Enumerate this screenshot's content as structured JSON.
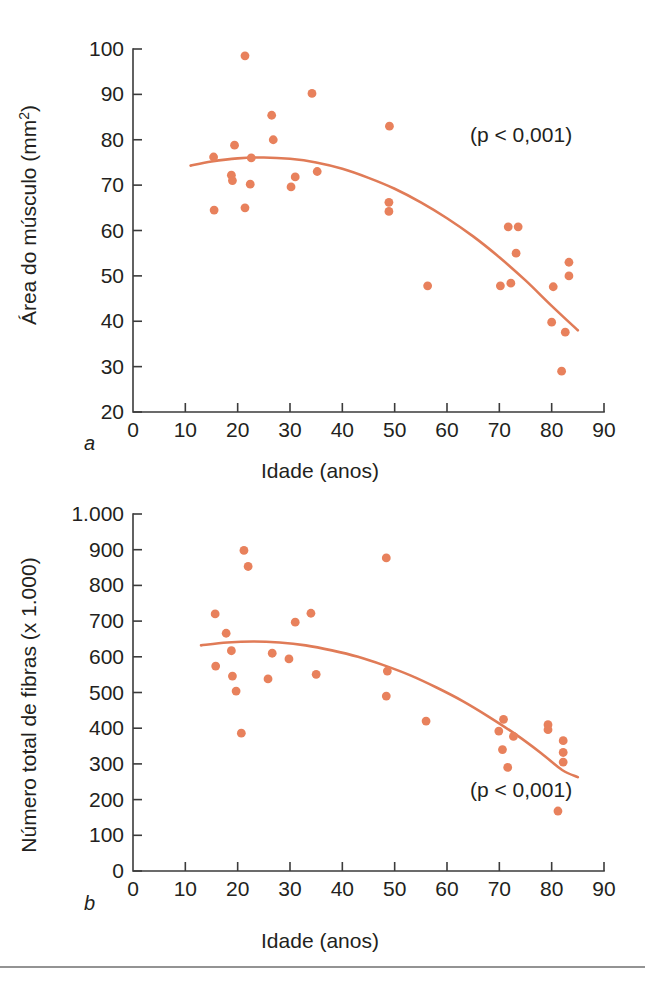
{
  "figure": {
    "dot_color": "#e8815c",
    "line_color": "#e07b57",
    "axis_color": "#3b3b3b",
    "panel_a_letter": "a",
    "panel_b_letter": "b"
  },
  "chart_data": [
    {
      "id": "panel-a",
      "type": "scatter",
      "title": "",
      "panel_label": "a",
      "xlabel": "Idade (anos)",
      "ylabel": "Área do músculo (mm²)",
      "ylabel_main": "Área do músculo (mm",
      "ylabel_sup": "2",
      "ylabel_tail": ")",
      "annotation": "(p < 0,001)",
      "xlim": [
        0,
        90
      ],
      "ylim": [
        20,
        100
      ],
      "xticks": [
        0,
        10,
        20,
        30,
        40,
        50,
        60,
        70,
        80,
        90
      ],
      "xticklabels": [
        "0",
        "10",
        "20",
        "30",
        "40",
        "50",
        "60",
        "70",
        "80",
        "90"
      ],
      "yticks": [
        20,
        30,
        40,
        50,
        60,
        70,
        80,
        90,
        100
      ],
      "yticklabels": [
        "20",
        "30",
        "40",
        "50",
        "60",
        "70",
        "80",
        "90",
        "100"
      ],
      "grid": false,
      "legend": "none",
      "points": [
        {
          "x": 21.4,
          "y": 98.5
        },
        {
          "x": 34.2,
          "y": 90.2
        },
        {
          "x": 26.5,
          "y": 85.4
        },
        {
          "x": 49.0,
          "y": 83.0
        },
        {
          "x": 26.8,
          "y": 80.0
        },
        {
          "x": 19.4,
          "y": 78.8
        },
        {
          "x": 15.4,
          "y": 76.2
        },
        {
          "x": 22.6,
          "y": 76.0
        },
        {
          "x": 35.2,
          "y": 73.0
        },
        {
          "x": 31.0,
          "y": 71.8
        },
        {
          "x": 18.8,
          "y": 72.2
        },
        {
          "x": 19.0,
          "y": 71.0
        },
        {
          "x": 22.4,
          "y": 70.2
        },
        {
          "x": 30.2,
          "y": 69.6
        },
        {
          "x": 48.9,
          "y": 66.2
        },
        {
          "x": 48.9,
          "y": 64.2
        },
        {
          "x": 21.4,
          "y": 65.0
        },
        {
          "x": 15.5,
          "y": 64.5
        },
        {
          "x": 71.7,
          "y": 60.8
        },
        {
          "x": 73.6,
          "y": 60.8
        },
        {
          "x": 73.2,
          "y": 55.0
        },
        {
          "x": 83.3,
          "y": 53.0
        },
        {
          "x": 83.3,
          "y": 50.0
        },
        {
          "x": 70.2,
          "y": 47.8
        },
        {
          "x": 72.2,
          "y": 48.4
        },
        {
          "x": 56.3,
          "y": 47.8
        },
        {
          "x": 80.3,
          "y": 47.6
        },
        {
          "x": 80.0,
          "y": 39.8
        },
        {
          "x": 82.6,
          "y": 37.6
        },
        {
          "x": 81.9,
          "y": 29.0
        }
      ],
      "fit_curve": [
        {
          "x": 11.0,
          "y": 74.3
        },
        {
          "x": 15.0,
          "y": 75.2
        },
        {
          "x": 20.0,
          "y": 75.9
        },
        {
          "x": 25.0,
          "y": 76.1
        },
        {
          "x": 30.0,
          "y": 75.8
        },
        {
          "x": 35.0,
          "y": 75.0
        },
        {
          "x": 40.0,
          "y": 73.6
        },
        {
          "x": 45.0,
          "y": 71.6
        },
        {
          "x": 50.0,
          "y": 69.2
        },
        {
          "x": 55.0,
          "y": 66.2
        },
        {
          "x": 60.0,
          "y": 62.7
        },
        {
          "x": 65.0,
          "y": 58.7
        },
        {
          "x": 70.0,
          "y": 54.1
        },
        {
          "x": 75.0,
          "y": 49.0
        },
        {
          "x": 80.0,
          "y": 43.4
        },
        {
          "x": 85.0,
          "y": 38.0
        }
      ]
    },
    {
      "id": "panel-b",
      "type": "scatter",
      "title": "",
      "panel_label": "b",
      "xlabel": "Idade (anos)",
      "ylabel": "Número total de fibras (x 1.000)",
      "annotation": "(p < 0,001)",
      "xlim": [
        0,
        90
      ],
      "ylim": [
        0,
        1000
      ],
      "xticks": [
        0,
        10,
        20,
        30,
        40,
        50,
        60,
        70,
        80,
        90
      ],
      "xticklabels": [
        "0",
        "10",
        "20",
        "30",
        "40",
        "50",
        "60",
        "70",
        "80",
        "90"
      ],
      "yticks": [
        0,
        100,
        200,
        300,
        400,
        500,
        600,
        700,
        800,
        900,
        1000
      ],
      "yticklabels": [
        "0",
        "100",
        "200",
        "300",
        "400",
        "500",
        "600",
        "700",
        "800",
        "900",
        "1.000"
      ],
      "grid": false,
      "legend": "none",
      "points": [
        {
          "x": 21.2,
          "y": 898
        },
        {
          "x": 48.4,
          "y": 877
        },
        {
          "x": 22.0,
          "y": 853
        },
        {
          "x": 34.0,
          "y": 722
        },
        {
          "x": 15.7,
          "y": 720
        },
        {
          "x": 31.0,
          "y": 697
        },
        {
          "x": 17.8,
          "y": 666
        },
        {
          "x": 18.8,
          "y": 617
        },
        {
          "x": 26.6,
          "y": 610
        },
        {
          "x": 29.8,
          "y": 594
        },
        {
          "x": 15.8,
          "y": 574
        },
        {
          "x": 48.6,
          "y": 560
        },
        {
          "x": 35.0,
          "y": 551
        },
        {
          "x": 19.0,
          "y": 546
        },
        {
          "x": 25.8,
          "y": 538
        },
        {
          "x": 19.7,
          "y": 504
        },
        {
          "x": 48.4,
          "y": 490
        },
        {
          "x": 56.0,
          "y": 420
        },
        {
          "x": 70.8,
          "y": 425
        },
        {
          "x": 79.3,
          "y": 410
        },
        {
          "x": 79.3,
          "y": 396
        },
        {
          "x": 69.9,
          "y": 392
        },
        {
          "x": 72.7,
          "y": 377
        },
        {
          "x": 82.2,
          "y": 365
        },
        {
          "x": 70.6,
          "y": 340
        },
        {
          "x": 82.2,
          "y": 332
        },
        {
          "x": 82.2,
          "y": 305
        },
        {
          "x": 71.6,
          "y": 290
        },
        {
          "x": 20.7,
          "y": 386
        },
        {
          "x": 81.2,
          "y": 168
        }
      ],
      "fit_curve": [
        {
          "x": 13.0,
          "y": 632
        },
        {
          "x": 18.0,
          "y": 640
        },
        {
          "x": 23.0,
          "y": 643
        },
        {
          "x": 28.0,
          "y": 640
        },
        {
          "x": 33.0,
          "y": 632
        },
        {
          "x": 38.0,
          "y": 618
        },
        {
          "x": 43.0,
          "y": 600
        },
        {
          "x": 48.0,
          "y": 576
        },
        {
          "x": 53.0,
          "y": 548
        },
        {
          "x": 58.0,
          "y": 514
        },
        {
          "x": 63.0,
          "y": 476
        },
        {
          "x": 68.0,
          "y": 432
        },
        {
          "x": 73.0,
          "y": 384
        },
        {
          "x": 78.0,
          "y": 330
        },
        {
          "x": 82.0,
          "y": 283
        },
        {
          "x": 85.0,
          "y": 263
        }
      ]
    }
  ]
}
